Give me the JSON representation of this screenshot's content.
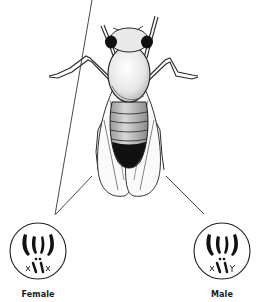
{
  "diagram": {
    "colors": {
      "ink": "#1a1a1a",
      "background": "#ffffff",
      "shade": "#d8d8d8"
    },
    "karyotypes": [
      {
        "label": "Female",
        "sex_chromosomes": [
          "X",
          "X"
        ],
        "autosome_pairs": 3
      },
      {
        "label": "Male",
        "sex_chromosomes": [
          "X",
          "Y"
        ],
        "autosome_pairs": 3
      }
    ]
  }
}
